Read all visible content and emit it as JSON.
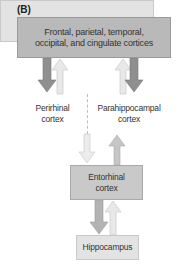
{
  "panel_label": "(B)",
  "nodes": {
    "top": {
      "line1": "Frontal, parietal, temporal,",
      "line2": "occipital, and cingulate cortices"
    },
    "perirhinal": {
      "line1": "Perirhinal",
      "line2": "cortex"
    },
    "parahippocampal": {
      "line1": "Parahippocampal",
      "line2": "cortex"
    },
    "entorhinal": {
      "line1": "Entorhinal",
      "line2": "cortex"
    },
    "hippocampus": {
      "line1": "Hippocampus"
    }
  },
  "edges": [
    {
      "from": "Frontal, parietal, temporal, occipital, and cingulate cortices",
      "to": "Perirhinal cortex",
      "style": "dark"
    },
    {
      "from": "Perirhinal cortex",
      "to": "Frontal, parietal, temporal, occipital, and cingulate cortices",
      "style": "light"
    },
    {
      "from": "Parahippocampal cortex",
      "to": "Frontal, parietal, temporal, occipital, and cingulate cortices",
      "style": "light"
    },
    {
      "from": "Frontal, parietal, temporal, occipital, and cingulate cortices",
      "to": "Parahippocampal cortex",
      "style": "dark"
    },
    {
      "from": "Perirhinal cortex",
      "to": "Entorhinal cortex",
      "style": "light"
    },
    {
      "from": "Entorhinal cortex",
      "to": "Parahippocampal cortex",
      "style": "medium"
    },
    {
      "from": "Entorhinal cortex",
      "to": "Hippocampus",
      "style": "medium"
    },
    {
      "from": "Hippocampus",
      "to": "Entorhinal cortex",
      "style": "light"
    }
  ],
  "colors": {
    "dark_box": "#b9b9b9",
    "light_box": "#e3e3e3",
    "dark_arrow": "#8f8f8f",
    "medium_arrow": "#b3b3b3",
    "light_arrow": "#e6e6e6"
  }
}
